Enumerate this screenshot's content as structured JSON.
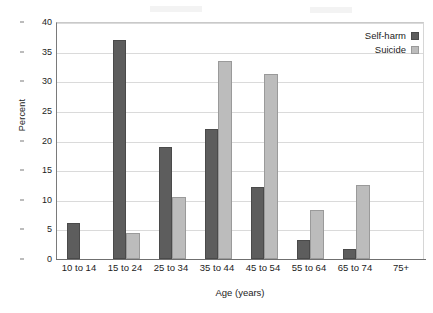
{
  "chart_data": {
    "type": "bar",
    "title": "",
    "xlabel": "Age (years)",
    "ylabel": "Percent",
    "categories": [
      "10 to 14",
      "15 to 24",
      "25 to 34",
      "35 to 44",
      "45 to 54",
      "55 to 64",
      "65 to 74",
      "75+"
    ],
    "series": [
      {
        "name": "Self-harm",
        "color": "#5d5d5d",
        "values": [
          6.1,
          37.0,
          18.9,
          21.9,
          12.1,
          3.2,
          1.7,
          0
        ]
      },
      {
        "name": "Suicide",
        "color": "#bcbcbc",
        "values": [
          0,
          4.4,
          10.5,
          33.4,
          31.3,
          8.3,
          12.5,
          0
        ]
      }
    ],
    "ylim": [
      0,
      40
    ],
    "yticks": [
      0,
      5,
      10,
      15,
      20,
      25,
      30,
      35,
      40
    ],
    "ytick_labels": [
      "0",
      "5",
      "10",
      "15",
      "20",
      "25",
      "30",
      "35",
      "40"
    ],
    "grid": "horizontal",
    "legend_position": "top-right",
    "legend_entries": [
      "Self-harm",
      "Suicide"
    ]
  }
}
